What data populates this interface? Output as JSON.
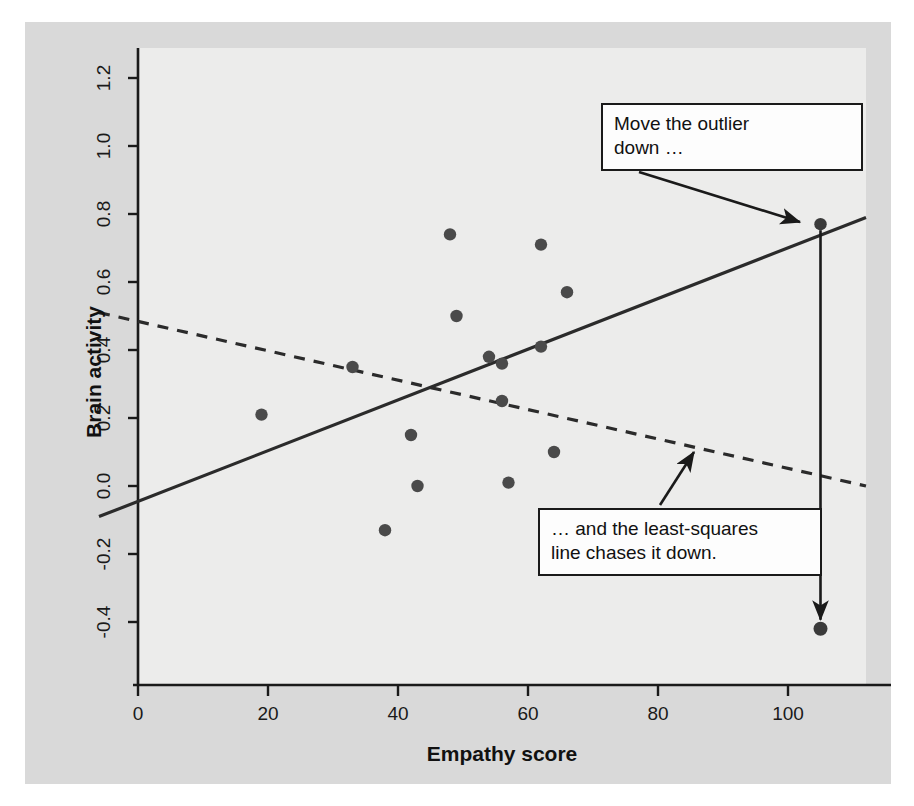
{
  "figure": {
    "background_color": "#d9d9d9",
    "plot_background_color": "#ececeb",
    "axis_color": "#1a1a1a",
    "point_color": "#404040"
  },
  "chart_data": {
    "type": "scatter",
    "title": "",
    "xlabel": "Empathy score",
    "ylabel": "Brain activity",
    "xlim": [
      -6,
      112
    ],
    "ylim": [
      -0.48,
      1.28
    ],
    "xticks": [
      0,
      20,
      40,
      60,
      80,
      100
    ],
    "xtick_labels": [
      "0",
      "20",
      "40",
      "60",
      "80",
      "100"
    ],
    "yticks": [
      -0.4,
      -0.2,
      0.0,
      0.2,
      0.4,
      0.6,
      0.8,
      1.0,
      1.2
    ],
    "ytick_labels": [
      "-0.4",
      "-0.2",
      "0.0",
      "0.2",
      "0.4",
      "0.6",
      "0.8",
      "1.0",
      "1.2"
    ],
    "grid": false,
    "legend": null,
    "points": [
      {
        "x": 19,
        "y": 0.21
      },
      {
        "x": 33,
        "y": 0.35
      },
      {
        "x": 38,
        "y": -0.13
      },
      {
        "x": 42,
        "y": 0.15
      },
      {
        "x": 43,
        "y": 0.0
      },
      {
        "x": 48,
        "y": 0.74
      },
      {
        "x": 49,
        "y": 0.5
      },
      {
        "x": 54,
        "y": 0.38
      },
      {
        "x": 56,
        "y": 0.36
      },
      {
        "x": 56,
        "y": 0.25
      },
      {
        "x": 57,
        "y": 0.01
      },
      {
        "x": 62,
        "y": 0.71
      },
      {
        "x": 62,
        "y": 0.41
      },
      {
        "x": 64,
        "y": 0.1
      },
      {
        "x": 66,
        "y": 0.57
      }
    ],
    "outlier_start": {
      "x": 105,
      "y": 0.77,
      "label": "outlier original position"
    },
    "outlier_end": {
      "x": 105,
      "y": -0.42,
      "label": "outlier moved position"
    },
    "lines": [
      {
        "name": "least-squares line with outlier high",
        "style": "solid",
        "x1": -6,
        "y1": -0.09,
        "x2": 112,
        "y2": 0.79
      },
      {
        "name": "least-squares line after outlier moved down",
        "style": "dashed",
        "x1": -6,
        "y1": 0.51,
        "x2": 112,
        "y2": 0.0
      }
    ],
    "annotations": [
      {
        "id": "move-outlier-down",
        "text": "Move the outlier\ndown …",
        "points_to": {
          "x": 105,
          "y": 0.77
        }
      },
      {
        "id": "least-squares-chases",
        "text": "… and the least-squares\nline chases it down.",
        "points_to": {
          "x": 87,
          "y": 0.12
        }
      }
    ],
    "arrows": [
      {
        "name": "outlier-move-arrow",
        "from": {
          "x": 105,
          "y": 0.77
        },
        "to": {
          "x": 105,
          "y": -0.42
        }
      }
    ]
  }
}
